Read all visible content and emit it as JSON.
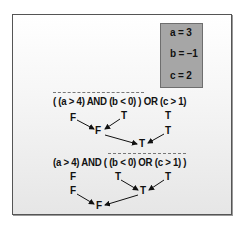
{
  "variables": [
    {
      "label": "a = 3"
    },
    {
      "label": "b = −1"
    },
    {
      "label": "c = 2"
    }
  ],
  "expression1": {
    "text": "( (a > 4) AND (b < 0) ) OR (c > 1)",
    "leaf_values": [
      "F",
      "T",
      "T"
    ],
    "intermediate": {
      "and_result": "F",
      "c_value": "T"
    },
    "result": "T"
  },
  "expression2": {
    "text": "(a > 4) AND ( (b < 0) OR (c > 1) )",
    "leaf_values": [
      "F",
      "T",
      "T"
    ],
    "intermediate": {
      "a_value": "F",
      "or_result": "T"
    },
    "result": "F"
  },
  "colors": {
    "value_box": "#a6a6a6",
    "frame_border": "#555555",
    "text": "#111111"
  }
}
